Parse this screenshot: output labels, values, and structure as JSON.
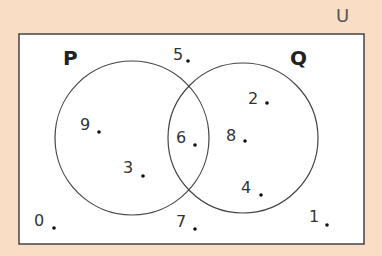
{
  "diagram": {
    "type": "venn",
    "universal_label": "U",
    "sets": [
      {
        "name": "P",
        "label": "P"
      },
      {
        "name": "Q",
        "label": "Q"
      }
    ],
    "elements": {
      "P_only": [
        "9",
        "3"
      ],
      "P_and_Q": [
        "6"
      ],
      "Q_only": [
        "2",
        "8",
        "4"
      ],
      "outside": [
        "5",
        "7",
        "0",
        "1"
      ]
    },
    "labels": {
      "e0": "0",
      "e1": "1",
      "e2": "2",
      "e3": "3",
      "e4": "4",
      "e5": "5",
      "e6": "6",
      "e7": "7",
      "e8": "8",
      "e9": "9"
    },
    "colors": {
      "background": "#f9dcc4",
      "box_fill": "#ffffff",
      "stroke": "#444444"
    }
  }
}
